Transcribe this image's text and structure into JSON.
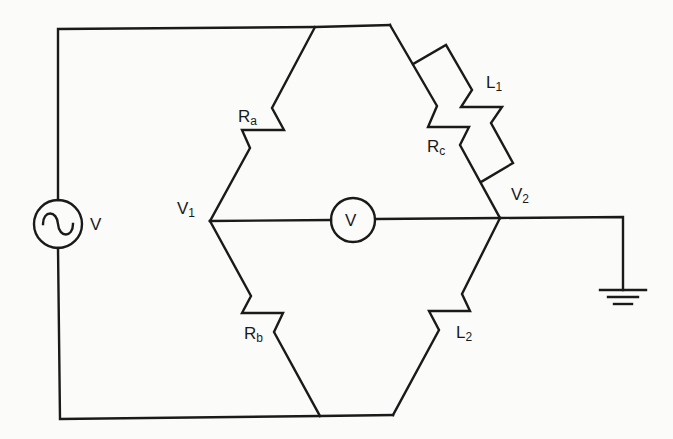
{
  "diagram": {
    "type": "AC bridge circuit (Maxwell/Hay-type inductance bridge)",
    "components": [
      {
        "id": "source",
        "kind": "ac-voltage-source",
        "label": "V"
      },
      {
        "id": "Ra",
        "kind": "resistor",
        "label_main": "R",
        "label_sub": "a",
        "between": [
          "top",
          "V1"
        ]
      },
      {
        "id": "Rb",
        "kind": "resistor",
        "label_main": "R",
        "label_sub": "b",
        "between": [
          "V1",
          "bottom"
        ]
      },
      {
        "id": "Rc",
        "kind": "resistor",
        "label_main": "R",
        "label_sub": "c",
        "between": [
          "top",
          "V2"
        ]
      },
      {
        "id": "L1",
        "kind": "inductor",
        "label_main": "L",
        "label_sub": "1",
        "between": [
          "top",
          "V2"
        ],
        "parallel_with": "Rc"
      },
      {
        "id": "L2",
        "kind": "inductor",
        "label_main": "L",
        "label_sub": "2",
        "between": [
          "V2",
          "bottom"
        ]
      },
      {
        "id": "meter",
        "kind": "voltmeter",
        "label": "V",
        "between": [
          "V1",
          "V2"
        ]
      },
      {
        "id": "gnd",
        "kind": "ground",
        "connected_to": "V2"
      }
    ],
    "nodes": [
      {
        "id": "V1",
        "label_main": "V",
        "label_sub": "1"
      },
      {
        "id": "V2",
        "label_main": "V",
        "label_sub": "2"
      }
    ]
  },
  "labels": {
    "source": "V",
    "meter": "V",
    "ra": {
      "main": "R",
      "sub": "a"
    },
    "rb": {
      "main": "R",
      "sub": "b"
    },
    "rc": {
      "main": "R",
      "sub": "c"
    },
    "l1": {
      "main": "L",
      "sub": "1"
    },
    "l2": {
      "main": "L",
      "sub": "2"
    },
    "v1": {
      "main": "V",
      "sub": "1"
    },
    "v2": {
      "main": "V",
      "sub": "2"
    }
  }
}
